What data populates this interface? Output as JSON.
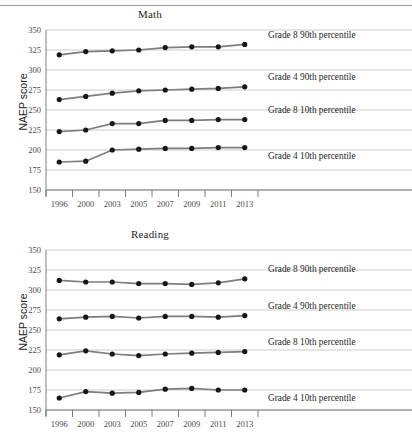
{
  "figure": {
    "ylabel": "NAEP score",
    "years": [
      "1996",
      "2000",
      "2003",
      "2005",
      "2007",
      "2009",
      "2011",
      "2013"
    ],
    "y_ticks": [
      "350",
      "325",
      "300",
      "275",
      "250",
      "225",
      "200",
      "175",
      "150"
    ],
    "colors": {
      "line": "#7d7d7d",
      "marker": "#161616",
      "grid": "#bfbfbf",
      "axis": "#6f6f6f",
      "text": "#231f20"
    }
  },
  "chart_data": [
    {
      "type": "line",
      "title": "Math",
      "xlabel": "",
      "ylabel": "NAEP score",
      "ylim": [
        150,
        350
      ],
      "yticks": [
        150,
        175,
        200,
        225,
        250,
        275,
        300,
        325,
        350
      ],
      "grid": true,
      "legend_position": "right-inline",
      "x": [
        "1996",
        "2000",
        "2003",
        "2005",
        "2007",
        "2009",
        "2011",
        "2013"
      ],
      "series": [
        {
          "name": "Grade 8 90th percentile",
          "values": [
            319,
            323,
            324,
            325,
            328,
            329,
            329,
            332
          ]
        },
        {
          "name": "Grade 4 90th percentile",
          "values": [
            263,
            267,
            271,
            274,
            275,
            276,
            277,
            279
          ]
        },
        {
          "name": "Grade 8 10th percentile",
          "values": [
            223,
            225,
            233,
            233,
            237,
            237,
            238,
            238
          ]
        },
        {
          "name": "Grade 4 10th percentile",
          "values": [
            185,
            186,
            200,
            201,
            202,
            202,
            203,
            203
          ]
        }
      ]
    },
    {
      "type": "line",
      "title": "Reading",
      "xlabel": "",
      "ylabel": "NAEP score",
      "ylim": [
        150,
        350
      ],
      "yticks": [
        150,
        175,
        200,
        225,
        250,
        275,
        300,
        325,
        350
      ],
      "grid": true,
      "legend_position": "right-inline",
      "x": [
        "1996",
        "2000",
        "2003",
        "2005",
        "2007",
        "2009",
        "2011",
        "2013"
      ],
      "series": [
        {
          "name": "Grade 8 90th percentile",
          "values": [
            312,
            310,
            310,
            308,
            308,
            307,
            309,
            314
          ]
        },
        {
          "name": "Grade 4 90th percentile",
          "values": [
            264,
            266,
            267,
            265,
            267,
            267,
            266,
            268
          ]
        },
        {
          "name": "Grade 8 10th percentile",
          "values": [
            219,
            224,
            220,
            218,
            220,
            221,
            222,
            223
          ]
        },
        {
          "name": "Grade 4 10th percentile",
          "values": [
            165,
            173,
            171,
            172,
            176,
            177,
            175,
            175
          ]
        }
      ]
    }
  ]
}
